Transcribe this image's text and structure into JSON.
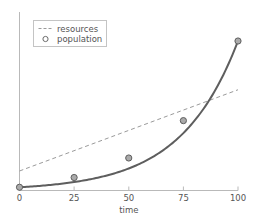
{
  "chart_data": {
    "type": "line",
    "title": "",
    "subtitle": "",
    "xlabel": "time",
    "ylabel": "",
    "xlim": [
      0,
      100
    ],
    "ylim": [
      0,
      100
    ],
    "grid": false,
    "legend_position": "upper-left",
    "xticks": [
      0,
      25,
      50,
      75,
      100
    ],
    "xtick_labels": [
      "0",
      "25",
      "50",
      "75",
      "100"
    ],
    "yticks": [],
    "ytick_labels": [],
    "series": [
      {
        "name": "resources",
        "style": "dashed",
        "marker": "none",
        "color": "#999999",
        "x": [
          0,
          100
        ],
        "values": [
          12,
          62
        ]
      },
      {
        "name": "population",
        "style": "solid",
        "marker": "circle",
        "color": "#555555",
        "marker_face_color": "#aaaaaa",
        "x": [
          0,
          25,
          50,
          75,
          100
        ],
        "values": [
          2,
          8,
          20,
          43,
          92
        ]
      }
    ]
  },
  "legend": {
    "entries": [
      {
        "label": "resources",
        "glyph": "dashed-line-sample"
      },
      {
        "label": "population",
        "glyph": "open-circle-marker"
      }
    ]
  },
  "axes": {
    "x_label": "time",
    "x_tick_labels": [
      "0",
      "25",
      "50",
      "75",
      "100"
    ]
  }
}
